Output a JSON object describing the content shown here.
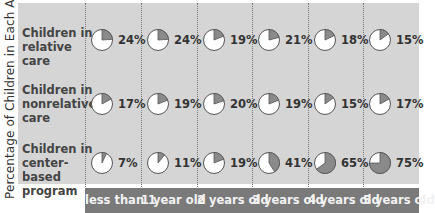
{
  "chart_data": {
    "type": "table",
    "title": "",
    "ylabel": "Percentage of Children in Each Age Group*",
    "xlabel": "",
    "categories": [
      "less than 1",
      "1 year old",
      "2 years old",
      "3 years old",
      "4 years old",
      "5 years old"
    ],
    "series": [
      {
        "name": "Children in relative care",
        "values": [
          24,
          24,
          19,
          21,
          18,
          15
        ]
      },
      {
        "name": "Children in nonrelative care",
        "values": [
          17,
          19,
          20,
          19,
          15,
          17
        ]
      },
      {
        "name": "Children in center-based program",
        "values": [
          7,
          11,
          19,
          41,
          65,
          75
        ]
      }
    ],
    "value_format": "percent",
    "marker": "pie",
    "grid": "dotted vertical",
    "colors": {
      "background": "#d5d5d5",
      "slice": "#8a8a8a",
      "pie_fill": "#ffffff",
      "header_bar": "#7a7a7a",
      "header_text": "#f2f2f2"
    }
  },
  "rows": [
    {
      "label_lines": [
        "Children in",
        "relative care"
      ],
      "cells": [
        "24%",
        "24%",
        "19%",
        "21%",
        "18%",
        "15%"
      ]
    },
    {
      "label_lines": [
        "Children in",
        "nonrelative",
        "care"
      ],
      "cells": [
        "17%",
        "19%",
        "20%",
        "19%",
        "15%",
        "17%"
      ]
    },
    {
      "label_lines": [
        "Children in",
        "center-based",
        "program"
      ],
      "cells": [
        "7%",
        "11%",
        "19%",
        "41%",
        "65%",
        "75%"
      ]
    }
  ],
  "columns": [
    "less than 1",
    "1 year old",
    "2 years old",
    "3 years old",
    "4 years old",
    "5 years old"
  ],
  "ylabel": "Percentage of Children in Each Age Group*"
}
